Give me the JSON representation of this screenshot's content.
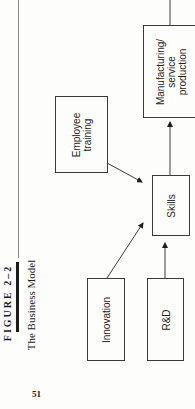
{
  "figure": {
    "label": "FIGURE 2–2",
    "title": "The Business Model"
  },
  "page_number": "51",
  "diagram": {
    "nodes": [
      {
        "id": "manufacturing",
        "label": "Manufacturing/\nservice\nproduction"
      },
      {
        "id": "employee_training",
        "label": "Employee\ntraining"
      },
      {
        "id": "skills",
        "label": "Skills"
      },
      {
        "id": "innovation",
        "label": "Innovation"
      },
      {
        "id": "rnd",
        "label": "R&D"
      }
    ],
    "edges": [
      {
        "from": "employee_training",
        "to": "skills"
      },
      {
        "from": "innovation",
        "to": "skills"
      },
      {
        "from": "rnd",
        "to": "skills"
      },
      {
        "from": "skills",
        "to": "manufacturing"
      }
    ],
    "labels": {
      "manufacturing": "Manufacturing/\nservice\nproduction",
      "employee_training": "Employee\ntraining",
      "skills": "Skills",
      "innovation": "Innovation",
      "rnd": "R&D"
    }
  },
  "colors": {
    "background": "#fdfdfb",
    "ink": "#1e1e1e",
    "line": "#3a3a3a"
  }
}
